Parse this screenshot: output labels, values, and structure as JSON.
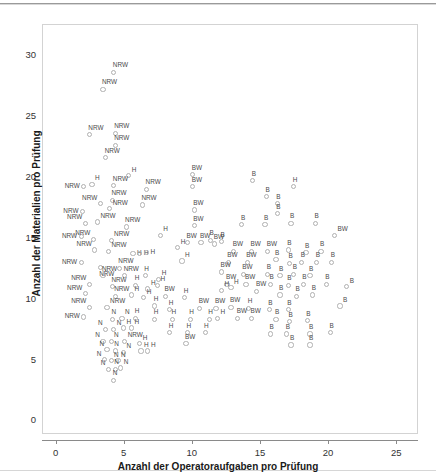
{
  "chart_data": {
    "type": "scatter",
    "title": "",
    "xlabel": "Anzahl der Operatoraufgaben pro Prüfung",
    "ylabel": "Anzahl der Materialien pro Prüfung",
    "xlim": [
      -1.0,
      26.6
    ],
    "ylim": [
      -1.2,
      32.5
    ],
    "xticks": [
      0,
      5,
      10,
      15,
      20,
      25
    ],
    "yticks": [
      0,
      5,
      10,
      15,
      20,
      25,
      30
    ],
    "grid": false,
    "legend": "none",
    "marker": "open-circle",
    "marker_color": "#b0b0b0",
    "label_color": "#4a4a4a",
    "groups": [
      "NRW",
      "BW",
      "H",
      "N",
      "B"
    ],
    "points": [
      {
        "label": "NRW",
        "x": 4.2,
        "y": 28.6,
        "lp": "t"
      },
      {
        "label": "NRW",
        "x": 3.4,
        "y": 27.2,
        "lp": "t"
      },
      {
        "label": "NRW",
        "x": 2.4,
        "y": 23.5,
        "lp": "t"
      },
      {
        "label": "NRW",
        "x": 4.3,
        "y": 23.6,
        "lp": "t"
      },
      {
        "label": "NRW",
        "x": 4.3,
        "y": 22.6,
        "lp": "t"
      },
      {
        "label": "NRW",
        "x": 3.6,
        "y": 21.6,
        "lp": "t"
      },
      {
        "label": "H",
        "x": 5.3,
        "y": 20.1,
        "lp": "tr"
      },
      {
        "label": "NRW",
        "x": 2.0,
        "y": 19.2,
        "lp": "l"
      },
      {
        "label": "H",
        "x": 2.6,
        "y": 19.4,
        "lp": "tr"
      },
      {
        "label": "NRW",
        "x": 4.2,
        "y": 19.3,
        "lp": "t"
      },
      {
        "label": "NRW",
        "x": 6.6,
        "y": 19.0,
        "lp": "t"
      },
      {
        "label": "BW",
        "x": 10.0,
        "y": 20.2,
        "lp": "t"
      },
      {
        "label": "BW",
        "x": 10.0,
        "y": 19.2,
        "lp": "t"
      },
      {
        "label": "B",
        "x": 14.4,
        "y": 19.7,
        "lp": "t"
      },
      {
        "label": "H",
        "x": 17.4,
        "y": 19.2,
        "lp": "t"
      },
      {
        "label": "NRW",
        "x": 4.1,
        "y": 18.1,
        "lp": "t"
      },
      {
        "label": "NRW",
        "x": 3.2,
        "y": 17.8,
        "lp": "tl"
      },
      {
        "label": "NRW",
        "x": 3.9,
        "y": 17.4,
        "lp": "tr"
      },
      {
        "label": "NRW",
        "x": 6.3,
        "y": 17.7,
        "lp": "t"
      },
      {
        "label": "NRW",
        "x": 1.9,
        "y": 17.2,
        "lp": "l"
      },
      {
        "label": "B",
        "x": 15.4,
        "y": 18.4,
        "lp": "t"
      },
      {
        "label": "B",
        "x": 16.2,
        "y": 17.8,
        "lp": "t"
      },
      {
        "label": "B",
        "x": 16.2,
        "y": 17.0,
        "lp": "t"
      },
      {
        "label": "BW",
        "x": 10.1,
        "y": 17.3,
        "lp": "t"
      },
      {
        "label": "NRW",
        "x": 2.1,
        "y": 16.2,
        "lp": "tl"
      },
      {
        "label": "NRW",
        "x": 3.0,
        "y": 16.3,
        "lp": "tr"
      },
      {
        "label": "NRW",
        "x": 5.1,
        "y": 15.9,
        "lp": "t"
      },
      {
        "label": "BW",
        "x": 10.1,
        "y": 16.0,
        "lp": "t"
      },
      {
        "label": "B",
        "x": 13.6,
        "y": 16.1,
        "lp": "t"
      },
      {
        "label": "B",
        "x": 15.3,
        "y": 16.1,
        "lp": "t"
      },
      {
        "label": "B",
        "x": 17.2,
        "y": 16.2,
        "lp": "t"
      },
      {
        "label": "B",
        "x": 19.0,
        "y": 16.2,
        "lp": "t"
      },
      {
        "label": "NRW",
        "x": 1.8,
        "y": 15.1,
        "lp": "l"
      },
      {
        "label": "NRW",
        "x": 2.7,
        "y": 14.9,
        "lp": "tl"
      },
      {
        "label": "NRW",
        "x": 4.0,
        "y": 14.8,
        "lp": "tr"
      },
      {
        "label": "H",
        "x": 7.6,
        "y": 15.2,
        "lp": "tr"
      },
      {
        "label": "BW",
        "x": 20.4,
        "y": 15.2,
        "lp": "tr"
      },
      {
        "label": "B",
        "x": 11.3,
        "y": 14.8,
        "lp": "t"
      },
      {
        "label": "B",
        "x": 12.1,
        "y": 14.7,
        "lp": "t"
      },
      {
        "label": "BW",
        "x": 9.6,
        "y": 14.6,
        "lp": "t"
      },
      {
        "label": "BW",
        "x": 10.6,
        "y": 14.6,
        "lp": "t"
      },
      {
        "label": "BW",
        "x": 11.6,
        "y": 14.5,
        "lp": "t"
      },
      {
        "label": "NRW",
        "x": 2.8,
        "y": 14.0,
        "lp": "tl"
      },
      {
        "label": "NRW",
        "x": 3.8,
        "y": 13.9,
        "lp": "tr"
      },
      {
        "label": "H",
        "x": 5.6,
        "y": 13.7,
        "lp": "r"
      },
      {
        "label": "H",
        "x": 6.1,
        "y": 13.7,
        "lp": "r"
      },
      {
        "label": "H",
        "x": 6.6,
        "y": 13.8,
        "lp": "r"
      },
      {
        "label": "H",
        "x": 8.9,
        "y": 14.2,
        "lp": "tr"
      },
      {
        "label": "BW",
        "x": 13.0,
        "y": 13.9,
        "lp": "t"
      },
      {
        "label": "BW",
        "x": 14.3,
        "y": 13.9,
        "lp": "t"
      },
      {
        "label": "BW",
        "x": 15.5,
        "y": 13.9,
        "lp": "t"
      },
      {
        "label": "B",
        "x": 17.0,
        "y": 14.0,
        "lp": "t"
      },
      {
        "label": "B",
        "x": 18.3,
        "y": 13.8,
        "lp": "t"
      },
      {
        "label": "B",
        "x": 19.4,
        "y": 13.9,
        "lp": "t"
      },
      {
        "label": "NRW",
        "x": 1.8,
        "y": 13.0,
        "lp": "l"
      },
      {
        "label": "NRW",
        "x": 3.2,
        "y": 12.6,
        "lp": "b"
      },
      {
        "label": "NRW",
        "x": 4.6,
        "y": 12.5,
        "lp": "t"
      },
      {
        "label": "H",
        "x": 9.2,
        "y": 13.1,
        "lp": "tr"
      },
      {
        "label": "BW",
        "x": 12.6,
        "y": 13.0,
        "lp": "t"
      },
      {
        "label": "BW",
        "x": 14.0,
        "y": 13.0,
        "lp": "t"
      },
      {
        "label": "B",
        "x": 16.1,
        "y": 13.2,
        "lp": "t"
      },
      {
        "label": "B",
        "x": 17.1,
        "y": 12.9,
        "lp": "t"
      },
      {
        "label": "B",
        "x": 18.0,
        "y": 13.0,
        "lp": "t"
      },
      {
        "label": "B",
        "x": 19.1,
        "y": 13.0,
        "lp": "t"
      },
      {
        "label": "B",
        "x": 20.2,
        "y": 13.0,
        "lp": "t"
      },
      {
        "label": "NRW",
        "x": 3.4,
        "y": 11.9,
        "lp": "t"
      },
      {
        "label": "NRW",
        "x": 5.0,
        "y": 11.9,
        "lp": "t"
      },
      {
        "label": "H",
        "x": 6.5,
        "y": 11.9,
        "lp": "t"
      },
      {
        "label": "H",
        "x": 7.5,
        "y": 11.6,
        "lp": "tr"
      },
      {
        "label": "BW",
        "x": 12.1,
        "y": 12.2,
        "lp": "t"
      },
      {
        "label": "BW",
        "x": 13.7,
        "y": 12.0,
        "lp": "t"
      },
      {
        "label": "B",
        "x": 15.5,
        "y": 12.0,
        "lp": "t"
      },
      {
        "label": "B",
        "x": 16.4,
        "y": 11.9,
        "lp": "t"
      },
      {
        "label": "B",
        "x": 17.4,
        "y": 12.0,
        "lp": "t"
      },
      {
        "label": "B",
        "x": 18.6,
        "y": 11.9,
        "lp": "t"
      },
      {
        "label": "NRW",
        "x": 2.4,
        "y": 11.2,
        "lp": "tl"
      },
      {
        "label": "NRW",
        "x": 4.1,
        "y": 11.0,
        "lp": "t"
      },
      {
        "label": "H",
        "x": 5.8,
        "y": 11.1,
        "lp": "t"
      },
      {
        "label": "H",
        "x": 6.7,
        "y": 10.8,
        "lp": "tr"
      },
      {
        "label": "H",
        "x": 7.4,
        "y": 11.1,
        "lp": "tr"
      },
      {
        "label": "BW",
        "x": 12.5,
        "y": 11.2,
        "lp": "t"
      },
      {
        "label": "BW",
        "x": 13.9,
        "y": 11.2,
        "lp": "t"
      },
      {
        "label": "B",
        "x": 15.7,
        "y": 11.2,
        "lp": "t"
      },
      {
        "label": "B",
        "x": 17.0,
        "y": 11.1,
        "lp": "t"
      },
      {
        "label": "B",
        "x": 18.1,
        "y": 11.2,
        "lp": "t"
      },
      {
        "label": "B",
        "x": 19.8,
        "y": 11.2,
        "lp": "t"
      },
      {
        "label": "NRW",
        "x": 2.1,
        "y": 10.4,
        "lp": "tl"
      },
      {
        "label": "NRW",
        "x": 4.3,
        "y": 10.2,
        "lp": "t"
      },
      {
        "label": "H",
        "x": 5.5,
        "y": 10.3,
        "lp": "tr"
      },
      {
        "label": "H",
        "x": 6.4,
        "y": 10.1,
        "lp": "tr"
      },
      {
        "label": "BW",
        "x": 8.0,
        "y": 10.2,
        "lp": "t"
      },
      {
        "label": "H",
        "x": 9.4,
        "y": 10.1,
        "lp": "t"
      },
      {
        "label": "H",
        "x": 12.1,
        "y": 10.7,
        "lp": "tr"
      },
      {
        "label": "H",
        "x": 12.8,
        "y": 10.9,
        "lp": "tr"
      },
      {
        "label": "BW",
        "x": 14.7,
        "y": 10.6,
        "lp": "t"
      },
      {
        "label": "B",
        "x": 16.4,
        "y": 10.3,
        "lp": "t"
      },
      {
        "label": "B",
        "x": 17.6,
        "y": 10.2,
        "lp": "t"
      },
      {
        "label": "B",
        "x": 18.8,
        "y": 10.3,
        "lp": "t"
      },
      {
        "label": "B",
        "x": 21.3,
        "y": 11.0,
        "lp": "tr"
      },
      {
        "label": "NRW",
        "x": 2.4,
        "y": 9.3,
        "lp": "tl"
      },
      {
        "label": "NRW",
        "x": 3.7,
        "y": 9.3,
        "lp": "tr"
      },
      {
        "label": "H",
        "x": 7.2,
        "y": 9.4,
        "lp": "t"
      },
      {
        "label": "H",
        "x": 8.3,
        "y": 9.1,
        "lp": "t"
      },
      {
        "label": "BW",
        "x": 10.5,
        "y": 9.2,
        "lp": "t"
      },
      {
        "label": "BW",
        "x": 11.7,
        "y": 9.2,
        "lp": "t"
      },
      {
        "label": "BW",
        "x": 12.8,
        "y": 9.3,
        "lp": "t"
      },
      {
        "label": "H",
        "x": 14.1,
        "y": 9.2,
        "lp": "t"
      },
      {
        "label": "B",
        "x": 15.6,
        "y": 9.1,
        "lp": "t"
      },
      {
        "label": "B",
        "x": 17.0,
        "y": 9.1,
        "lp": "t"
      },
      {
        "label": "B",
        "x": 20.8,
        "y": 9.4,
        "lp": "tr"
      },
      {
        "label": "NRW",
        "x": 2.0,
        "y": 8.5,
        "lp": "l"
      },
      {
        "label": "N",
        "x": 4.1,
        "y": 8.3,
        "lp": "t"
      },
      {
        "label": "N",
        "x": 4.8,
        "y": 8.4,
        "lp": "tr"
      },
      {
        "label": "H",
        "x": 5.8,
        "y": 8.4,
        "lp": "t"
      },
      {
        "label": "H",
        "x": 7.2,
        "y": 8.3,
        "lp": "t"
      },
      {
        "label": "H",
        "x": 8.5,
        "y": 8.3,
        "lp": "t"
      },
      {
        "label": "H",
        "x": 9.8,
        "y": 8.3,
        "lp": "t"
      },
      {
        "label": "H",
        "x": 11.2,
        "y": 8.3,
        "lp": "t"
      },
      {
        "label": "H",
        "x": 11.8,
        "y": 8.4,
        "lp": "tr"
      },
      {
        "label": "BW",
        "x": 13.3,
        "y": 8.4,
        "lp": "t"
      },
      {
        "label": "BW",
        "x": 14.3,
        "y": 8.4,
        "lp": "t"
      },
      {
        "label": "B",
        "x": 16.1,
        "y": 8.3,
        "lp": "t"
      },
      {
        "label": "B",
        "x": 17.1,
        "y": 8.1,
        "lp": "t"
      },
      {
        "label": "B",
        "x": 18.4,
        "y": 8.2,
        "lp": "t"
      },
      {
        "label": "N",
        "x": 3.6,
        "y": 7.5,
        "lp": "tl"
      },
      {
        "label": "N",
        "x": 4.2,
        "y": 7.5,
        "lp": "tr"
      },
      {
        "label": "H",
        "x": 4.9,
        "y": 7.6,
        "lp": "tr"
      },
      {
        "label": "H",
        "x": 5.5,
        "y": 7.6,
        "lp": "tr"
      },
      {
        "label": "H",
        "x": 8.3,
        "y": 7.2,
        "lp": "t"
      },
      {
        "label": "H",
        "x": 9.6,
        "y": 7.2,
        "lp": "t"
      },
      {
        "label": "H",
        "x": 10.9,
        "y": 7.2,
        "lp": "t"
      },
      {
        "label": "B",
        "x": 15.7,
        "y": 7.1,
        "lp": "t"
      },
      {
        "label": "B",
        "x": 16.9,
        "y": 7.1,
        "lp": "t"
      },
      {
        "label": "B",
        "x": 18.6,
        "y": 7.1,
        "lp": "t"
      },
      {
        "label": "B",
        "x": 20.1,
        "y": 7.2,
        "lp": "t"
      },
      {
        "label": "N",
        "x": 3.4,
        "y": 6.5,
        "lp": "tl"
      },
      {
        "label": "N",
        "x": 4.0,
        "y": 6.5,
        "lp": "tr"
      },
      {
        "label": "NRW",
        "x": 5.0,
        "y": 6.5,
        "lp": "tr"
      },
      {
        "label": "H",
        "x": 6.1,
        "y": 6.3,
        "lp": "tr"
      },
      {
        "label": "BW",
        "x": 9.5,
        "y": 6.3,
        "lp": "t"
      },
      {
        "label": "B",
        "x": 17.2,
        "y": 6.2,
        "lp": "t"
      },
      {
        "label": "B",
        "x": 18.6,
        "y": 6.2,
        "lp": "t"
      },
      {
        "label": "N",
        "x": 3.7,
        "y": 5.8,
        "lp": "tl"
      },
      {
        "label": "N",
        "x": 4.3,
        "y": 5.7,
        "lp": "t"
      },
      {
        "label": "N",
        "x": 4.9,
        "y": 5.6,
        "lp": "tr"
      },
      {
        "label": "H",
        "x": 6.2,
        "y": 5.7,
        "lp": "tr"
      },
      {
        "label": "H",
        "x": 6.7,
        "y": 5.7,
        "lp": "tr"
      },
      {
        "label": "N",
        "x": 3.5,
        "y": 5.0,
        "lp": "tl"
      },
      {
        "label": "N",
        "x": 4.0,
        "y": 4.9,
        "lp": "tr"
      },
      {
        "label": "N",
        "x": 4.5,
        "y": 4.9,
        "lp": "tr"
      },
      {
        "label": "N",
        "x": 3.8,
        "y": 4.2,
        "lp": "tl"
      },
      {
        "label": "N",
        "x": 4.3,
        "y": 4.2,
        "lp": "t"
      },
      {
        "label": "N",
        "x": 4.7,
        "y": 4.3,
        "lp": "tr"
      },
      {
        "label": "N",
        "x": 4.2,
        "y": 3.3,
        "lp": "t"
      }
    ]
  },
  "axes": {
    "x_tick_labels": [
      "0",
      "5",
      "10",
      "15",
      "20",
      "25"
    ],
    "y_tick_labels": [
      "0",
      "5",
      "10",
      "15",
      "20",
      "25",
      "30"
    ],
    "x_title": "Anzahl der Operatoraufgaben pro Prüfung",
    "y_title": "Anzahl der Materialien pro Prüfung"
  }
}
